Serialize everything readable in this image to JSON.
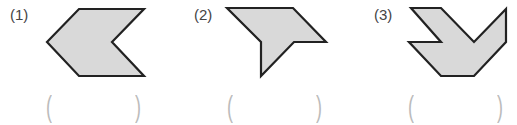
{
  "problems": [
    {
      "label": "(1)",
      "shape": "hexagon-chevron",
      "points": "79,9 144,9 112,42 144,76 79,76 47,42",
      "answer_open": "(",
      "answer_close": ")"
    },
    {
      "label": "(2)",
      "shape": "hexagon-concave",
      "points": "227,8 293,8 326,42 294,42 261,76 261,42",
      "answer_open": "(",
      "answer_close": ")"
    },
    {
      "label": "(3)",
      "shape": "nonagon-concave",
      "points": "411,8 441,8 474,42 506,9 506,42 474,76 441,76 409,42 441,42",
      "answer_open": "(",
      "answer_close": ")"
    }
  ],
  "colors": {
    "fill": "#d9d9d9",
    "stroke": "#222222",
    "paren": "#bbbbbb"
  }
}
